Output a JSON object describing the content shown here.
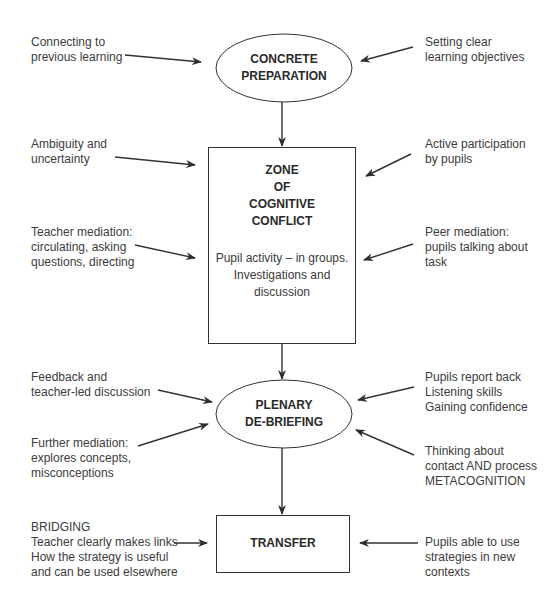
{
  "nodes": {
    "concrete": {
      "line1": "CONCRETE",
      "line2": "PREPARATION",
      "shape": "ellipse"
    },
    "zone": {
      "title": [
        "ZONE",
        "OF",
        "COGNITIVE",
        "CONFLICT"
      ],
      "body": [
        "Pupil activity – in groups.",
        "Investigations and",
        "discussion"
      ],
      "shape": "rectangle"
    },
    "plenary": {
      "line1": "PLENARY",
      "line2": "DE-BRIEFING",
      "shape": "ellipse"
    },
    "transfer": {
      "label": "TRANSFER",
      "shape": "rectangle"
    }
  },
  "inputs": {
    "left": [
      {
        "target": "concrete",
        "lines": [
          "Connecting to",
          "previous learning"
        ]
      },
      {
        "target": "zone",
        "lines": [
          "Ambiguity and",
          "uncertainty"
        ]
      },
      {
        "target": "zone",
        "lines": [
          "Teacher mediation:",
          "circulating, asking",
          "questions, directing"
        ]
      },
      {
        "target": "plenary",
        "lines": [
          "Feedback and",
          "teacher-led discussion"
        ]
      },
      {
        "target": "plenary",
        "lines": [
          "Further mediation:",
          "explores concepts,",
          "misconceptions"
        ]
      },
      {
        "target": "transfer",
        "lines": [
          "BRIDGING",
          "Teacher clearly makes links",
          "How the strategy is useful",
          "and can be used elsewhere"
        ]
      }
    ],
    "right": [
      {
        "target": "concrete",
        "lines": [
          "Setting clear",
          "learning objectives"
        ]
      },
      {
        "target": "zone",
        "lines": [
          "Active participation",
          "by pupils"
        ]
      },
      {
        "target": "zone",
        "lines": [
          "Peer mediation:",
          "pupils talking about",
          "task"
        ]
      },
      {
        "target": "plenary",
        "lines": [
          "Pupils report back",
          "Listening skills",
          "Gaining confidence"
        ]
      },
      {
        "target": "plenary",
        "lines": [
          "Thinking about",
          "contact AND process",
          "METACOGNITION"
        ]
      },
      {
        "target": "transfer",
        "lines": [
          "Pupils able to use",
          "strategies in new",
          "contexts"
        ]
      }
    ]
  },
  "flow": [
    "concrete",
    "zone",
    "plenary",
    "transfer"
  ],
  "colors": {
    "stroke": "#333333",
    "text": "#3c3c3c",
    "background": "#ffffff"
  }
}
